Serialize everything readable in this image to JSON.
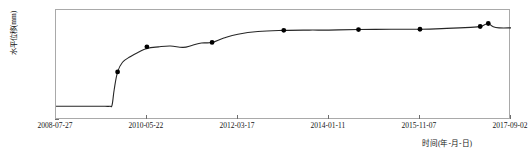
{
  "chart_data": {
    "type": "line",
    "title": "",
    "xlabel": "时间(年-月-日)",
    "ylabel": "水平位移(mm)",
    "ylim": [
      -50,
      350
    ],
    "yticks": [
      350,
      300,
      250,
      200,
      150,
      100,
      50,
      0,
      -50
    ],
    "xticks": [
      "2008-07-27",
      "2010-05-22",
      "2012-03-17",
      "2014-01-11",
      "2015-11-07",
      "2017-09-02"
    ],
    "grid": false,
    "legend": null,
    "line_color": "#262626",
    "marker_color": "#000000",
    "series": [
      {
        "name": "水平位移",
        "x": [
          "2008-07-27",
          "2008-10-20",
          "2009-01-25",
          "2009-05-10",
          "2009-07-20",
          "2009-08-25",
          "2009-09-10",
          "2009-09-25",
          "2009-10-20",
          "2009-11-25",
          "2010-01-20",
          "2010-03-20",
          "2010-05-22",
          "2010-08-15",
          "2010-11-10",
          "2011-02-10",
          "2011-04-20",
          "2011-06-25",
          "2011-09-10",
          "2011-12-05",
          "2012-03-17",
          "2012-08-10",
          "2013-02-15",
          "2013-08-20",
          "2014-01-11",
          "2014-08-15",
          "2015-04-10",
          "2015-11-07",
          "2016-05-20",
          "2016-11-10",
          "2017-01-20",
          "2017-02-25",
          "2017-03-20",
          "2017-04-25",
          "2017-06-10",
          "2017-09-02"
        ],
        "y": [
          0,
          0,
          0,
          0,
          0,
          0,
          5,
          60,
          125,
          160,
          180,
          196,
          210,
          216,
          219,
          214,
          222,
          230,
          232,
          248,
          262,
          272,
          276,
          277,
          277,
          279,
          280,
          280,
          283,
          287,
          290,
          297,
          301,
          289,
          285,
          285
        ]
      }
    ],
    "markers": [
      {
        "x": "2009-10-20",
        "y": 125
      },
      {
        "x": "2010-05-22",
        "y": 216
      },
      {
        "x": "2011-09-10",
        "y": 232
      },
      {
        "x": "2013-02-15",
        "y": 276
      },
      {
        "x": "2014-08-15",
        "y": 279
      },
      {
        "x": "2015-11-07",
        "y": 280
      },
      {
        "x": "2017-01-20",
        "y": 290
      },
      {
        "x": "2017-03-20",
        "y": 301
      }
    ]
  }
}
